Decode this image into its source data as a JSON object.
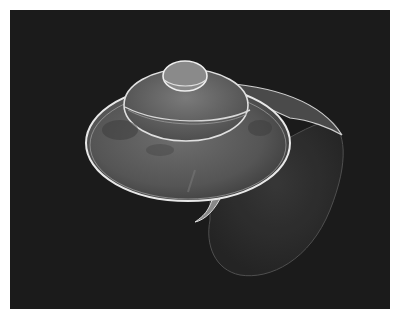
{
  "image": {
    "subject": "snail-shell-sem-micrograph",
    "background_color": "#1b1b1b",
    "border_color": "#ffffff",
    "shell_outline_color": "#e8e8e8",
    "shell_fill_color": "#5a5a5a"
  }
}
